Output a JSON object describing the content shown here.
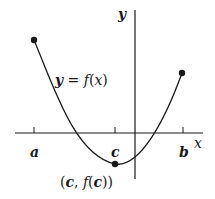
{
  "diagram": {
    "axes": {
      "x_label": "x",
      "y_label": "y"
    },
    "curve_label": {
      "lhs": "y",
      "eq": " = ",
      "fn": "f",
      "open": "(",
      "var": "x",
      "close": ")"
    },
    "ticks": [
      {
        "label": "a"
      },
      {
        "label": "c"
      },
      {
        "label": "b"
      }
    ],
    "min_point_label": {
      "open": "(",
      "c": "c",
      "comma": ", ",
      "fn": "f",
      "open2": "(",
      "c2": "c",
      "close": "))"
    },
    "colors": {
      "stroke": "#1a1a1a",
      "background": "#ffffff"
    }
  }
}
